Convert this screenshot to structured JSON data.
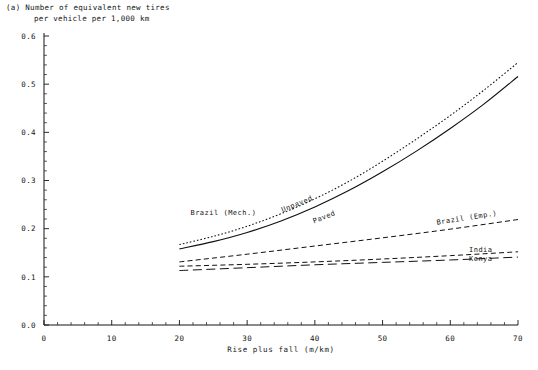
{
  "figure": {
    "panel_label": "(a)",
    "title_line1": "(a) Number of equivalent new tires",
    "title_line2": "per vehicle per 1,000 km"
  },
  "chart_data": {
    "type": "line",
    "title": "(a) Number of equivalent new tires per vehicle per 1,000 km",
    "xlabel": "Rise plus fall (m/km)",
    "ylabel": "",
    "xlim": [
      0,
      70
    ],
    "ylim": [
      0.0,
      0.6
    ],
    "xticks": [
      0,
      10,
      20,
      30,
      40,
      50,
      60,
      70
    ],
    "xtick_labels": [
      "0",
      "10",
      "20",
      "30",
      "40",
      "50",
      "60",
      "70"
    ],
    "yticks": [
      0.0,
      0.1,
      0.2,
      0.3,
      0.4,
      0.5,
      0.6
    ],
    "ytick_labels": [
      "0.0",
      "0.1",
      "0.2",
      "0.3",
      "0.4",
      "0.5",
      "0.6"
    ],
    "x_minor_tick_step": 2,
    "y_minor_tick_step": 0.02,
    "grid": false,
    "legend_position": "inline-annotations",
    "series": [
      {
        "name": "Brazil (Mech.) Unpaved",
        "label": "Unpaved",
        "style": "dotted",
        "x": [
          20,
          25,
          30,
          35,
          40,
          45,
          50,
          55,
          60,
          65,
          70
        ],
        "y": [
          0.167,
          0.184,
          0.205,
          0.231,
          0.262,
          0.298,
          0.34,
          0.386,
          0.435,
          0.488,
          0.545
        ]
      },
      {
        "name": "Brazil (Mech.) Paved",
        "label": "Paved",
        "style": "solid",
        "x": [
          20,
          25,
          30,
          35,
          40,
          45,
          50,
          55,
          60,
          65,
          70
        ],
        "y": [
          0.158,
          0.173,
          0.192,
          0.216,
          0.245,
          0.279,
          0.318,
          0.361,
          0.408,
          0.459,
          0.516
        ]
      },
      {
        "name": "Brazil (Emp.)",
        "label": "Brazil (Emp.)",
        "style": "dashed",
        "x": [
          20,
          30,
          40,
          50,
          60,
          70
        ],
        "y": [
          0.131,
          0.147,
          0.164,
          0.181,
          0.199,
          0.219
        ]
      },
      {
        "name": "India",
        "label": "India",
        "style": "dashed",
        "x": [
          20,
          30,
          40,
          50,
          60,
          70
        ],
        "y": [
          0.122,
          0.126,
          0.131,
          0.137,
          0.144,
          0.152
        ]
      },
      {
        "name": "Kenya",
        "label": "Kenya",
        "style": "dashlong",
        "x": [
          20,
          30,
          40,
          50,
          60,
          70
        ],
        "y": [
          0.113,
          0.119,
          0.125,
          0.13,
          0.135,
          0.141
        ]
      }
    ],
    "annotations": [
      {
        "name": "brazil-mech-label",
        "text": "Brazil (Mech.)",
        "x": 26.5,
        "y": 0.228,
        "rotation": 0
      },
      {
        "name": "unpaved-label",
        "text": "Unpaved",
        "x": 37.5,
        "y": 0.247,
        "rotation": -22
      },
      {
        "name": "paved-label",
        "text": "Paved",
        "x": 41.5,
        "y": 0.22,
        "rotation": -22
      },
      {
        "name": "brazil-emp-label",
        "text": "Brazil (Emp.)",
        "x": 62.5,
        "y": 0.218,
        "rotation": -9
      },
      {
        "name": "india-label",
        "text": "India",
        "x": 64.5,
        "y": 0.152,
        "rotation": 0
      },
      {
        "name": "kenya-label",
        "text": "Kenya",
        "x": 64.5,
        "y": 0.133,
        "rotation": 0
      }
    ]
  },
  "axis": {
    "x_title": "Rise plus fall (m/km)"
  }
}
